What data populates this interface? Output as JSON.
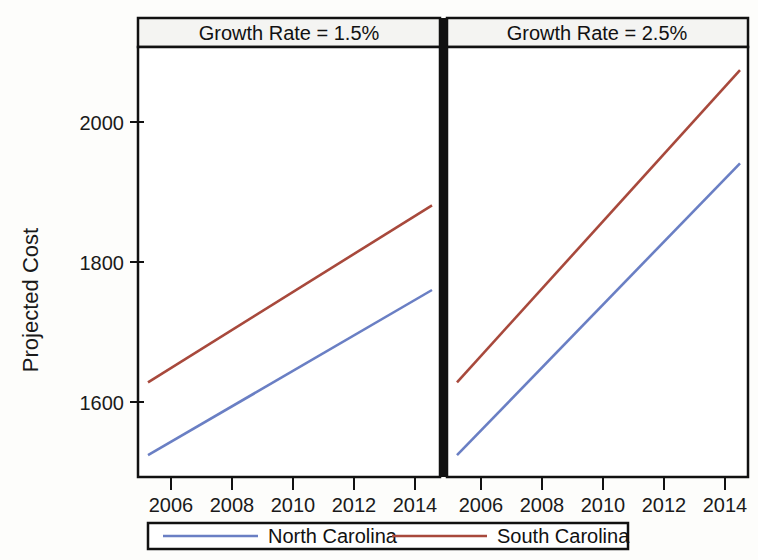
{
  "chart_data": {
    "type": "line",
    "title": "",
    "xlabel": "",
    "ylabel": "Projected Cost",
    "xlim": [
      2005,
      2015
    ],
    "ylim": [
      1500,
      2100
    ],
    "grid": false,
    "legend_position": "bottom",
    "y_ticks": [
      1600,
      1800,
      2000
    ],
    "x_ticks": [
      2006,
      2008,
      2010,
      2012,
      2014
    ],
    "panels": [
      {
        "strip_label": "Growth Rate = 1.5%",
        "series": [
          {
            "name": "North Carolina",
            "color": "#6a7fc4",
            "x": [
              2005,
              2015
            ],
            "values": [
              1524,
              1760
            ]
          },
          {
            "name": "South Carolina",
            "color": "#a8493c",
            "x": [
              2005,
              2015
            ],
            "values": [
              1628,
              1881
            ]
          }
        ]
      },
      {
        "strip_label": "Growth Rate = 2.5%",
        "series": [
          {
            "name": "North Carolina",
            "color": "#6a7fc4",
            "x": [
              2005,
              2015
            ],
            "values": [
              1524,
              1941
            ]
          },
          {
            "name": "South Carolina",
            "color": "#a8493c",
            "x": [
              2005,
              2015
            ],
            "values": [
              1628,
              2074
            ]
          }
        ]
      }
    ],
    "legend": [
      {
        "label": "North Carolina",
        "color": "#6a7fc4"
      },
      {
        "label": "South Carolina",
        "color": "#a8493c"
      }
    ]
  },
  "axis": {
    "y_label": "Projected Cost",
    "y_tick_labels": [
      "2000",
      "1800",
      "1600"
    ],
    "x_tick_labels_left": [
      "2006",
      "2008",
      "2010",
      "2012",
      "2014"
    ],
    "x_tick_labels_right": [
      "2006",
      "2008",
      "2010",
      "2012",
      "2014"
    ]
  },
  "panels": {
    "left_strip": "Growth Rate = 1.5%",
    "right_strip": "Growth Rate = 2.5%"
  },
  "legend": {
    "item_1": "North Carolina",
    "item_2": "South Carolina"
  },
  "colors": {
    "north_carolina": "#6a7fc4",
    "south_carolina": "#a8493c",
    "axis": "#111111",
    "background": "#fdfdfb"
  }
}
